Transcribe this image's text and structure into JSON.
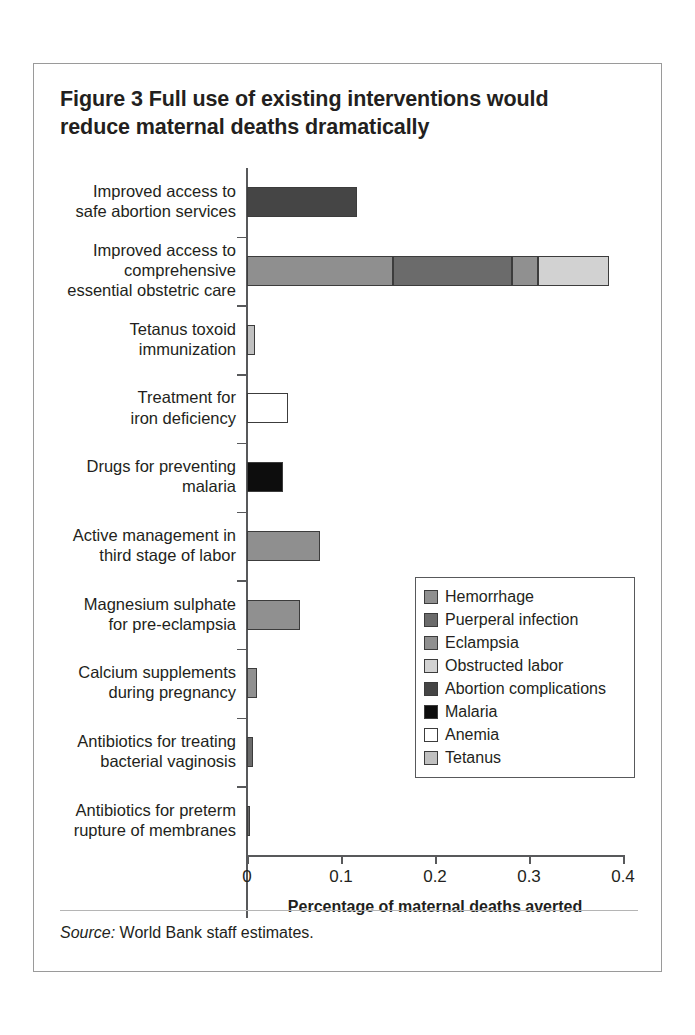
{
  "figure": {
    "number_label": "Figure 3",
    "title": "Full use of existing interventions would reduce maternal deaths dramatically",
    "title_line1": "Figure 3  Full use of existing interventions would",
    "title_line2": "reduce maternal deaths dramatically",
    "source_word": "Source:",
    "source_text": " World Bank staff estimates."
  },
  "chart_data": {
    "type": "bar",
    "orientation": "horizontal",
    "stacked": true,
    "title": "Full use of existing interventions would reduce maternal deaths dramatically",
    "xlabel": "Percentage of maternal deaths averted",
    "ylabel": "",
    "xlim": [
      0,
      0.4
    ],
    "xticks": [
      0,
      0.1,
      0.2,
      0.3,
      0.4
    ],
    "xticklabels": [
      "0",
      "0.1",
      "0.2",
      "0.3",
      "0.4"
    ],
    "grid": false,
    "legend_position": "middle-right-inside",
    "categories": [
      "Improved access to safe abortion services",
      "Improved access to comprehensive essential obstetric care",
      "Tetanus toxoid immunization",
      "Treatment for iron deficiency",
      "Drugs for preventing malaria",
      "Active management in third stage of labor",
      "Magnesium sulphate for pre-eclampsia",
      "Calcium supplements during pregnancy",
      "Antibiotics for treating bacterial vaginosis",
      "Antibiotics for preterm rupture of membranes"
    ],
    "category_lines": [
      [
        "Improved access to",
        "safe abortion services"
      ],
      [
        "Improved access to",
        "comprehensive",
        "essential obstetric care"
      ],
      [
        "Tetanus toxoid",
        "immunization"
      ],
      [
        "Treatment for",
        "iron deficiency"
      ],
      [
        "Drugs for preventing",
        "malaria"
      ],
      [
        "Active management in",
        "third stage of labor"
      ],
      [
        "Magnesium sulphate",
        "for pre-eclampsia"
      ],
      [
        "Calcium supplements",
        "during pregnancy"
      ],
      [
        "Antibiotics for treating",
        "bacterial vaginosis"
      ],
      [
        "Antibiotics for preterm",
        "rupture of membranes"
      ]
    ],
    "series": [
      {
        "name": "Hemorrhage",
        "color": "#8f8f8f",
        "values": [
          0,
          0.155,
          0,
          0,
          0,
          0.078,
          0.056,
          0.011,
          0,
          0
        ]
      },
      {
        "name": "Puerperal infection",
        "color": "#6b6b6b",
        "values": [
          0,
          0.127,
          0,
          0,
          0,
          0,
          0,
          0,
          0.006,
          0.003
        ]
      },
      {
        "name": "Eclampsia",
        "color": "#909090",
        "values": [
          0,
          0.028,
          0,
          0,
          0,
          0,
          0,
          0,
          0,
          0
        ]
      },
      {
        "name": "Obstructed labor",
        "color": "#d2d2d2",
        "values": [
          0,
          0.075,
          0,
          0,
          0,
          0,
          0,
          0,
          0,
          0
        ]
      },
      {
        "name": "Abortion complications",
        "color": "#454545",
        "values": [
          0.117,
          0,
          0,
          0,
          0,
          0,
          0,
          0,
          0,
          0
        ]
      },
      {
        "name": "Malaria",
        "color": "#0d0d0d",
        "values": [
          0,
          0,
          0,
          0,
          0.038,
          0,
          0,
          0,
          0,
          0
        ]
      },
      {
        "name": "Anemia",
        "color": "#ffffff",
        "values": [
          0,
          0,
          0,
          0.044,
          0,
          0,
          0,
          0,
          0,
          0
        ]
      },
      {
        "name": "Tetanus",
        "color": "#c0c0c0",
        "values": [
          0,
          0,
          0.008,
          0,
          0,
          0,
          0,
          0,
          0,
          0
        ]
      }
    ],
    "bar_totals": [
      0.117,
      0.385,
      0.008,
      0.044,
      0.038,
      0.078,
      0.056,
      0.011,
      0.006,
      0.003
    ],
    "bars": [
      {
        "category": "Improved access to safe abortion services",
        "segments": [
          {
            "series": "Abortion complications",
            "value": 0.117,
            "color": "#454545"
          }
        ]
      },
      {
        "category": "Improved access to comprehensive essential obstetric care",
        "segments": [
          {
            "series": "Hemorrhage",
            "value": 0.155,
            "color": "#8f8f8f"
          },
          {
            "series": "Puerperal infection",
            "value": 0.127,
            "color": "#6b6b6b"
          },
          {
            "series": "Eclampsia",
            "value": 0.028,
            "color": "#909090"
          },
          {
            "series": "Obstructed labor",
            "value": 0.075,
            "color": "#d2d2d2"
          }
        ]
      },
      {
        "category": "Tetanus toxoid immunization",
        "segments": [
          {
            "series": "Tetanus",
            "value": 0.008,
            "color": "#c0c0c0"
          }
        ]
      },
      {
        "category": "Treatment for iron deficiency",
        "segments": [
          {
            "series": "Anemia",
            "value": 0.044,
            "color": "#ffffff"
          }
        ]
      },
      {
        "category": "Drugs for preventing malaria",
        "segments": [
          {
            "series": "Malaria",
            "value": 0.038,
            "color": "#0d0d0d"
          }
        ]
      },
      {
        "category": "Active management in third stage of labor",
        "segments": [
          {
            "series": "Hemorrhage",
            "value": 0.078,
            "color": "#8f8f8f"
          }
        ]
      },
      {
        "category": "Magnesium sulphate for pre-eclampsia",
        "segments": [
          {
            "series": "Eclampsia",
            "value": 0.056,
            "color": "#909090"
          }
        ]
      },
      {
        "category": "Calcium supplements during pregnancy",
        "segments": [
          {
            "series": "Eclampsia",
            "value": 0.011,
            "color": "#909090"
          }
        ]
      },
      {
        "category": "Antibiotics for treating bacterial vaginosis",
        "segments": [
          {
            "series": "Puerperal infection",
            "value": 0.006,
            "color": "#6b6b6b"
          }
        ]
      },
      {
        "category": "Antibiotics for preterm rupture of membranes",
        "segments": [
          {
            "series": "Puerperal infection",
            "value": 0.003,
            "color": "#6b6b6b"
          }
        ]
      }
    ]
  },
  "legend": {
    "items": [
      {
        "label": "Hemorrhage",
        "color": "#8f8f8f"
      },
      {
        "label": "Puerperal infection",
        "color": "#6b6b6b"
      },
      {
        "label": "Eclampsia",
        "color": "#909090"
      },
      {
        "label": "Obstructed labor",
        "color": "#d2d2d2"
      },
      {
        "label": "Abortion complications",
        "color": "#454545"
      },
      {
        "label": "Malaria",
        "color": "#0d0d0d"
      },
      {
        "label": "Anemia",
        "color": "#ffffff"
      },
      {
        "label": "Tetanus",
        "color": "#c0c0c0"
      }
    ]
  }
}
